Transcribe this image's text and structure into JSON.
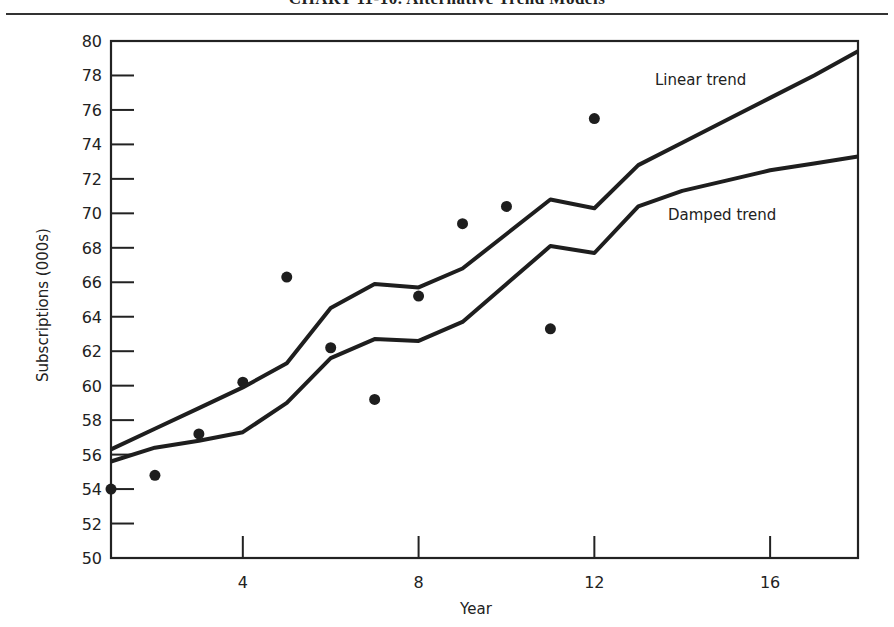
{
  "chart_data": {
    "type": "line",
    "title": "CHART 11-10. Alternative Trend Models",
    "xlabel": "Year",
    "ylabel": "Subscriptions (000s)",
    "xlim": [
      1,
      18
    ],
    "ylim": [
      50,
      80
    ],
    "x_ticks": [
      4,
      8,
      12,
      16
    ],
    "y_ticks": [
      50,
      52,
      54,
      56,
      58,
      60,
      62,
      64,
      66,
      68,
      70,
      72,
      74,
      76,
      78,
      80
    ],
    "grid": false,
    "legend": "inline labels",
    "observations": {
      "name": "Actual subscriptions",
      "type": "scatter",
      "x": [
        1,
        2,
        3,
        4,
        5,
        6,
        7,
        8,
        9,
        10,
        11,
        12
      ],
      "y": [
        54.0,
        54.8,
        57.2,
        60.2,
        66.3,
        62.2,
        59.2,
        65.2,
        69.4,
        70.4,
        63.3,
        75.5
      ]
    },
    "series": [
      {
        "name": "Linear trend",
        "x": [
          1,
          2,
          3,
          4,
          5,
          6,
          7,
          8,
          9,
          10,
          11,
          12,
          13,
          14,
          15,
          16,
          17,
          18
        ],
        "values": [
          56.3,
          57.5,
          58.7,
          59.9,
          61.3,
          64.5,
          65.9,
          65.7,
          66.8,
          68.8,
          70.8,
          70.3,
          72.8,
          74.1,
          75.4,
          76.7,
          78.0,
          79.4
        ]
      },
      {
        "name": "Damped trend",
        "x": [
          1,
          2,
          3,
          4,
          5,
          6,
          7,
          8,
          9,
          10,
          11,
          12,
          13,
          14,
          15,
          16,
          17,
          18
        ],
        "values": [
          55.6,
          56.4,
          56.8,
          57.3,
          59.0,
          61.6,
          62.7,
          62.6,
          63.7,
          65.9,
          68.1,
          67.7,
          70.4,
          71.3,
          71.9,
          72.5,
          72.9,
          73.3
        ]
      }
    ],
    "annotations": [
      {
        "text": "Linear trend",
        "x": 13.5,
        "y": 77.6
      },
      {
        "text": "Damped trend",
        "x": 13.7,
        "y": 69.9
      }
    ]
  },
  "labels": {
    "title": "CHART 11-10. Alternative Trend Models",
    "xlabel": "Year",
    "ylabel": "Subscriptions (000s)",
    "linear": "Linear trend",
    "damped": "Damped trend"
  }
}
